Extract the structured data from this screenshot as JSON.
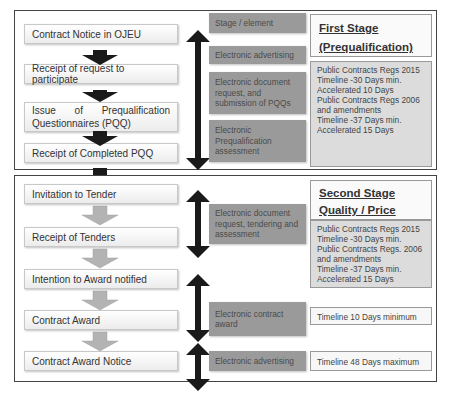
{
  "stage1": {
    "header": "Stage / element",
    "title_line1": "First Stage",
    "title_line2": "(Prequalification)",
    "steps": [
      {
        "label": "Contract Notice in OJEU"
      },
      {
        "label": "Receipt of request to participate"
      },
      {
        "label": "Issue of Prequalification Questionnaires (PQQ)"
      },
      {
        "label": "Receipt of Completed PQQ"
      }
    ],
    "elements": [
      {
        "label": "Electronic advertising"
      },
      {
        "label": "Electronic document request, and submission of PQQs"
      },
      {
        "label": "Electronic Prequalification assessment"
      }
    ],
    "info_lines": [
      "Public Contracts Regs 2015",
      "Timeline -30 Days min.",
      "Accelerated 10 Days",
      "Public Contracts Regs 2006",
      "and amendments",
      "Timeline -37 Days min.",
      "Accelerated 15 Days"
    ]
  },
  "stage2": {
    "title_line1": "Second Stage",
    "title_line2": "Quality / Price",
    "steps": [
      {
        "label": "Invitation to Tender"
      },
      {
        "label": "Receipt of Tenders"
      },
      {
        "label": "Intention to Award notified"
      },
      {
        "label": "Contract Award"
      },
      {
        "label": "Contract Award Notice"
      }
    ],
    "elements": [
      {
        "label": "Electronic document request, tendering and assessment"
      },
      {
        "label": "Electronic contract award"
      },
      {
        "label": "Electronic advertising"
      }
    ],
    "info_lines": [
      "Public Contracts Regs 2015",
      "Timeline -30 Days min.",
      "Public Contracts Regs. 2006",
      "and amendments",
      "Timeline -37 Days min.",
      "Accelerated 15 Days"
    ],
    "timeline_award": "Timeline 10 Days minimum",
    "timeline_notice": "Timeline 48 Days maximum"
  },
  "colors": {
    "element_box": "#9a9a9a",
    "arrow_dark": "#1a1a1a",
    "arrow_grey": "#b3b3b3",
    "info_grey": "#dcdcdc"
  }
}
